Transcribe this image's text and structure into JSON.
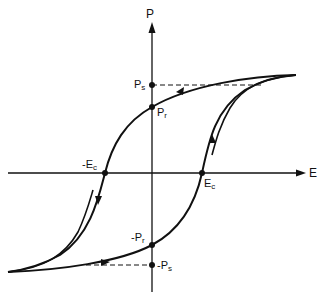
{
  "diagram": {
    "type": "ferroelectric-hysteresis-loop",
    "axes": {
      "x_label": "E",
      "y_label": "P"
    },
    "points": {
      "Ps": {
        "main": "P",
        "sub": "s"
      },
      "Pr": {
        "main": "P",
        "sub": "r"
      },
      "negEc": {
        "main": "-E",
        "sub": "c"
      },
      "Ec": {
        "main": "E",
        "sub": "c"
      },
      "negPr": {
        "main": "-P",
        "sub": "r"
      },
      "negPs": {
        "main": "-P",
        "sub": "s"
      }
    },
    "colors": {
      "line": "#111111",
      "background": "#ffffff"
    }
  }
}
